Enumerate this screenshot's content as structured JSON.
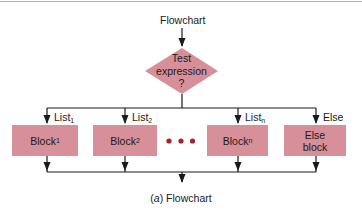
{
  "diagram": {
    "title": "Flowchart",
    "decision": {
      "line1": "Test",
      "line2": "expression",
      "line3": "?"
    },
    "branches": [
      {
        "label": "List",
        "label_sub": "1",
        "block": "Block",
        "block_sub": "1"
      },
      {
        "label": "List",
        "label_sub": "2",
        "block": "Block",
        "block_sub": "2"
      },
      {
        "label": "List",
        "label_sub": "n",
        "block": "Block",
        "block_sub": "n"
      },
      {
        "label": "Else",
        "label_sub": "",
        "block_line1": "Else",
        "block_line2": "block"
      }
    ],
    "ellipsis": "• • •",
    "caption": {
      "prefix_open": "(",
      "prefix_letter": "a",
      "prefix_close": ")",
      "text": " Flowchart"
    }
  },
  "colors": {
    "block_fill": "#d7909a",
    "decision_fill": "#d7909a",
    "ellipsis_dots": "#a8202a",
    "lines": "#1a1a1a",
    "top_rule": "#c9a7ab"
  }
}
